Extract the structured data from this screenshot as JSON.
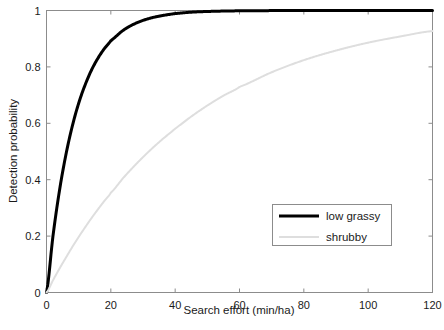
{
  "chart_data": {
    "type": "line",
    "title": "",
    "subtitle": "",
    "xlabel": "Search effort (min/ha)",
    "ylabel": "Detection probability",
    "xlim": [
      0,
      120
    ],
    "ylim": [
      0,
      1
    ],
    "xticks": [
      0,
      20,
      40,
      60,
      80,
      100,
      120
    ],
    "xtick_labels": [
      "0",
      "20",
      "40",
      "60",
      "80",
      "100",
      "120"
    ],
    "yticks": [
      0,
      0.2,
      0.4,
      0.6,
      0.8,
      1
    ],
    "ytick_labels": [
      "0",
      "0.2",
      "0.4",
      "0.6",
      "0.8",
      "1"
    ],
    "grid": false,
    "legend_position": "lower right",
    "x": [
      0,
      2,
      4,
      6,
      8,
      10,
      12,
      14,
      16,
      18,
      20,
      24,
      28,
      32,
      36,
      40,
      45,
      50,
      55,
      60,
      70,
      80,
      90,
      100,
      110,
      120
    ],
    "series": [
      {
        "name": "low grassy",
        "color": "#000000",
        "linewidth": 3,
        "values": [
          0.0,
          0.199,
          0.359,
          0.487,
          0.589,
          0.671,
          0.736,
          0.789,
          0.831,
          0.865,
          0.893,
          0.931,
          0.956,
          0.972,
          0.982,
          0.989,
          0.994,
          0.9965,
          0.998,
          0.9989,
          0.9996,
          0.9999,
          1.0,
          1.0,
          1.0,
          1.0
        ]
      },
      {
        "name": "shrubby",
        "color": "#dedede",
        "linewidth": 2,
        "values": [
          0.0,
          0.043,
          0.084,
          0.123,
          0.161,
          0.197,
          0.231,
          0.264,
          0.295,
          0.325,
          0.354,
          0.408,
          0.457,
          0.502,
          0.543,
          0.581,
          0.624,
          0.663,
          0.698,
          0.729,
          0.781,
          0.824,
          0.858,
          0.886,
          0.908,
          0.927
        ]
      }
    ],
    "annotations": []
  },
  "legend": {
    "entries": [
      {
        "label": "low grassy"
      },
      {
        "label": "shrubby"
      }
    ]
  },
  "colors": {
    "series_low_grassy": "#000000",
    "series_shrubby": "#dedede",
    "axis": "#8c8c8c",
    "text": "#1a1a1a",
    "background": "#ffffff"
  }
}
